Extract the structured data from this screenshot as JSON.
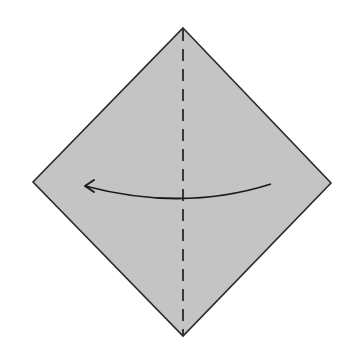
{
  "diagram": {
    "title": "Origami step: valley fold in half, right to left",
    "type": "origami-fold-diagram",
    "paper": {
      "shape": "square-rotated-diamond",
      "fill": "#c4c4c4",
      "stroke": "#2a2a2a",
      "vertices": {
        "top": [
          183,
          28
        ],
        "right": [
          331,
          183
        ],
        "bottom": [
          183,
          336
        ],
        "left": [
          33,
          182
        ]
      }
    },
    "fold_line": {
      "kind": "valley-fold",
      "style": "dashed",
      "orientation": "vertical",
      "from": [
        183,
        28
      ],
      "to": [
        183,
        336
      ],
      "color": "#2a2a2a"
    },
    "arrow": {
      "kind": "fold-direction",
      "direction": "right-to-left",
      "from": [
        271,
        184
      ],
      "via": [
        183,
        212
      ],
      "to": [
        85,
        186
      ],
      "color": "#1a1a1a"
    }
  }
}
